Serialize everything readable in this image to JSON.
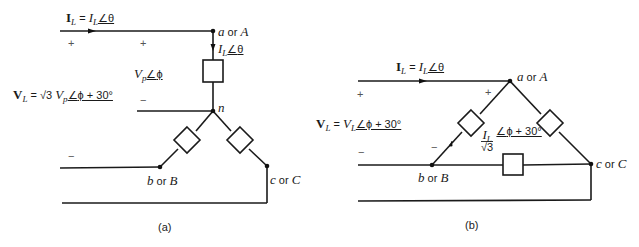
{
  "figure": {
    "panel_a": {
      "caption": "(a)",
      "line_current": {
        "bold": "I",
        "sub": "L",
        "eq": " = ",
        "mag": "I",
        "mag_sub": "L",
        "angle": "θ"
      },
      "phase_current": {
        "mag": "I",
        "mag_sub": "L",
        "angle": "θ"
      },
      "phase_voltage": {
        "mag": "V",
        "mag_sub": "p",
        "angle": "ϕ"
      },
      "line_voltage": {
        "bold": "V",
        "sub": "L",
        "eq": " = √3 ",
        "mag": "V",
        "mag_sub": "p",
        "angle": "ϕ + 30°"
      },
      "nodes": {
        "a": "a",
        "a_or": " or ",
        "A": "A",
        "n": "n",
        "b": "b",
        "b_or": " or ",
        "B": "B",
        "c": "c",
        "c_or": " or ",
        "C": "C"
      },
      "signs": {
        "plus": "+",
        "minus": "−"
      }
    },
    "panel_b": {
      "caption": "(b)",
      "line_current": {
        "bold": "I",
        "sub": "L",
        "eq": " = ",
        "mag": "I",
        "mag_sub": "L",
        "angle": "θ"
      },
      "line_voltage": {
        "bold": "V",
        "sub": "L",
        "eq": " = ",
        "mag": "V",
        "mag_sub": "L",
        "angle": "ϕ + 30°"
      },
      "phase_current": {
        "num": "I",
        "num_sub": "L",
        "den": "√3",
        "angle": "ϕ + 30°"
      },
      "nodes": {
        "a": "a",
        "a_or": " or ",
        "A": "A",
        "b": "b",
        "b_or": " or ",
        "B": "B",
        "c": "c",
        "c_or": " or ",
        "C": "C"
      },
      "signs": {
        "plus": "+",
        "minus": "−"
      }
    }
  },
  "colors": {
    "wire": "#1a1a1a",
    "background": "#ffffff"
  }
}
